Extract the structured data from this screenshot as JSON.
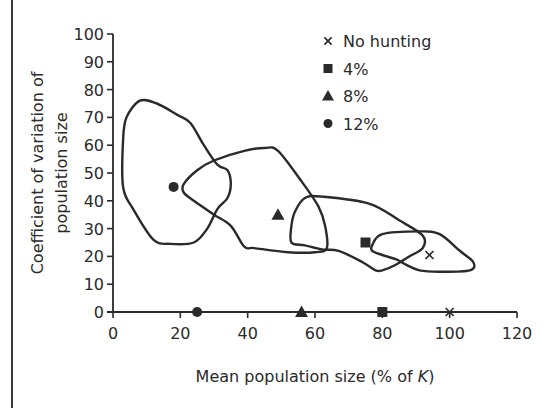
{
  "chart_data": {
    "type": "scatter",
    "title": "",
    "xlabel": "Mean population size (% of K)",
    "xlabel_parts": {
      "prefix": "Mean population size (% of ",
      "italic": "K",
      "suffix": ")"
    },
    "ylabel_lines": [
      "Coefficient of variation of",
      "population size"
    ],
    "ylabel": "Coefficient of variation of population size",
    "xlim": [
      0,
      120
    ],
    "ylim": [
      0,
      100
    ],
    "x_ticks": [
      0,
      20,
      40,
      60,
      80,
      100,
      120
    ],
    "y_ticks": [
      0,
      10,
      20,
      30,
      40,
      50,
      60,
      70,
      80,
      90,
      100
    ],
    "grid": false,
    "legend_position": "upper right",
    "legend": [
      {
        "label": "No hunting",
        "marker": "cross"
      },
      {
        "label": "4%",
        "marker": "square"
      },
      {
        "label": "8%",
        "marker": "triangle"
      },
      {
        "label": "12%",
        "marker": "circle"
      }
    ],
    "series": [
      {
        "name": "No hunting",
        "marker": "cross",
        "mean_point": {
          "x": 94,
          "y": 20.5
        },
        "axis_point": {
          "x": 100,
          "y": 0
        },
        "envelope": [
          [
            77,
            24
          ],
          [
            80,
            28
          ],
          [
            91,
            29
          ],
          [
            97,
            28
          ],
          [
            103,
            22
          ],
          [
            107,
            18
          ],
          [
            106,
            15
          ],
          [
            97,
            14.5
          ],
          [
            91,
            15
          ],
          [
            87,
            17
          ],
          [
            84,
            19
          ],
          [
            80,
            20.5
          ],
          [
            77,
            22
          ]
        ]
      },
      {
        "name": "4%",
        "marker": "square",
        "mean_point": {
          "x": 75,
          "y": 25
        },
        "axis_point": {
          "x": 80,
          "y": 0
        },
        "envelope": [
          [
            57,
            41
          ],
          [
            62,
            41.5
          ],
          [
            76,
            39
          ],
          [
            85,
            33
          ],
          [
            92,
            27.5
          ],
          [
            92,
            23
          ],
          [
            88,
            20
          ],
          [
            84,
            17
          ],
          [
            80,
            15
          ],
          [
            78,
            15
          ],
          [
            74,
            18
          ],
          [
            67,
            22
          ],
          [
            62,
            22.5
          ],
          [
            57,
            24
          ],
          [
            53,
            25
          ],
          [
            53,
            31
          ],
          [
            54,
            36
          ]
        ]
      },
      {
        "name": "8%",
        "marker": "triangle",
        "mean_point": {
          "x": 49,
          "y": 35
        },
        "axis_point": {
          "x": 56,
          "y": 0
        },
        "envelope": [
          [
            21,
            46
          ],
          [
            25,
            51
          ],
          [
            30,
            54.5
          ],
          [
            39,
            58
          ],
          [
            45,
            59
          ],
          [
            49,
            58
          ],
          [
            56,
            47
          ],
          [
            61,
            38
          ],
          [
            63,
            31
          ],
          [
            63.5,
            23
          ],
          [
            60,
            21.5
          ],
          [
            52,
            21.5
          ],
          [
            42,
            23
          ],
          [
            39,
            23.5
          ],
          [
            35,
            31
          ],
          [
            30,
            35
          ],
          [
            24,
            40
          ],
          [
            21,
            43
          ]
        ]
      },
      {
        "name": "12%",
        "marker": "circle",
        "mean_point": {
          "x": 18,
          "y": 45
        },
        "axis_point": {
          "x": 25,
          "y": 0
        },
        "envelope": [
          [
            8,
            76
          ],
          [
            13,
            75
          ],
          [
            19,
            71
          ],
          [
            23,
            68
          ],
          [
            27,
            60
          ],
          [
            31,
            53
          ],
          [
            34,
            51
          ],
          [
            35,
            46
          ],
          [
            34,
            41
          ],
          [
            31,
            37
          ],
          [
            28,
            30
          ],
          [
            24,
            25
          ],
          [
            17,
            24.5
          ],
          [
            12,
            26
          ],
          [
            6,
            37
          ],
          [
            3,
            45
          ],
          [
            3,
            62
          ],
          [
            4,
            70
          ]
        ]
      }
    ]
  }
}
